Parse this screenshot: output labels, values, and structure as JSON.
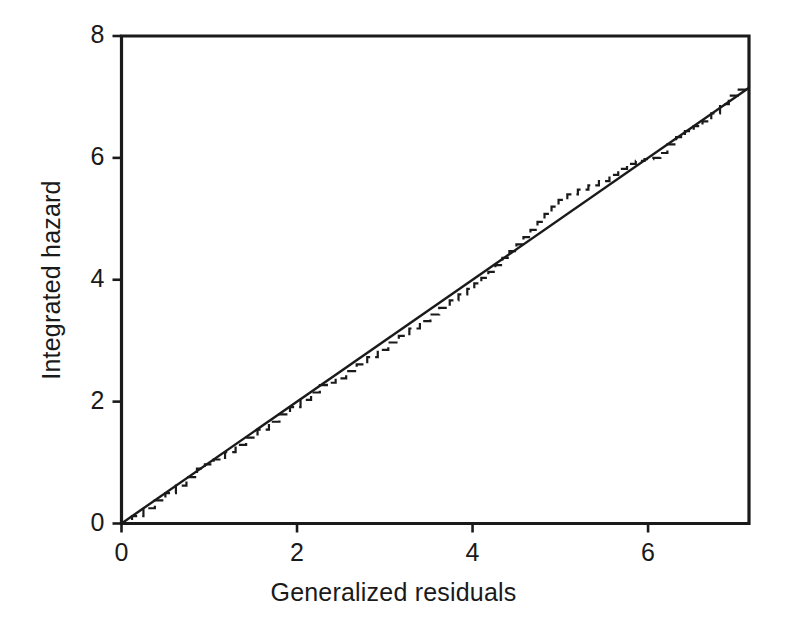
{
  "chart_data": {
    "type": "line",
    "title": "",
    "xlabel": "Generalized residuals",
    "ylabel": "Integrated hazard",
    "xlim": [
      0,
      7.15
    ],
    "ylim": [
      0,
      8
    ],
    "xticks": [
      0,
      2,
      4,
      6
    ],
    "yticks": [
      0,
      2,
      4,
      6,
      8
    ],
    "xtick_labels": [
      "0",
      "2",
      "4",
      "6"
    ],
    "ytick_labels": [
      "0",
      "2",
      "4",
      "6",
      "8"
    ],
    "grid": false,
    "legend": "none",
    "frame": "box",
    "series": [
      {
        "name": "Reference line (y = x)",
        "style": "solid",
        "color": "#1a1a1a",
        "linewidth": 2.4,
        "x": [
          0.0,
          7.15
        ],
        "y": [
          0.0,
          7.15
        ]
      },
      {
        "name": "Nelson-Aalen integrated hazard",
        "style": "dashed",
        "drawstyle": "steps-post",
        "color": "#1a1a1a",
        "linewidth": 2.2,
        "x": [
          0.0,
          0.12,
          0.25,
          0.38,
          0.5,
          0.62,
          0.74,
          0.86,
          0.95,
          1.05,
          1.18,
          1.3,
          1.42,
          1.55,
          1.68,
          1.8,
          1.92,
          2.04,
          2.16,
          2.26,
          2.34,
          2.44,
          2.56,
          2.68,
          2.8,
          2.92,
          3.04,
          3.16,
          3.28,
          3.4,
          3.52,
          3.62,
          3.74,
          3.84,
          3.94,
          4.02,
          4.1,
          4.18,
          4.26,
          4.34,
          4.42,
          4.5,
          4.58,
          4.66,
          4.74,
          4.82,
          4.9,
          4.98,
          5.08,
          5.2,
          5.32,
          5.44,
          5.56,
          5.66,
          5.76,
          5.86,
          5.96,
          6.06,
          6.14,
          6.22,
          6.32,
          6.42,
          6.52,
          6.62,
          6.72,
          6.82,
          6.92,
          7.02,
          7.15
        ],
        "y": [
          0.0,
          0.12,
          0.25,
          0.38,
          0.5,
          0.62,
          0.76,
          0.9,
          0.97,
          1.05,
          1.17,
          1.29,
          1.41,
          1.54,
          1.67,
          1.79,
          1.91,
          2.03,
          2.15,
          2.27,
          2.31,
          2.38,
          2.5,
          2.61,
          2.73,
          2.85,
          2.97,
          3.08,
          3.2,
          3.32,
          3.43,
          3.54,
          3.66,
          3.76,
          3.85,
          3.94,
          4.03,
          4.13,
          4.24,
          4.36,
          4.47,
          4.58,
          4.7,
          4.82,
          4.95,
          5.08,
          5.2,
          5.31,
          5.4,
          5.48,
          5.55,
          5.62,
          5.72,
          5.82,
          5.9,
          5.95,
          5.98,
          6.0,
          6.08,
          6.22,
          6.34,
          6.44,
          6.52,
          6.6,
          6.73,
          6.88,
          7.02,
          7.12,
          7.18
        ]
      }
    ]
  },
  "labels": {
    "x_axis_title": "Generalized residuals",
    "y_axis_title": "Integrated hazard"
  },
  "colors": {
    "foreground": "#1a1a1a",
    "background": "#ffffff"
  }
}
